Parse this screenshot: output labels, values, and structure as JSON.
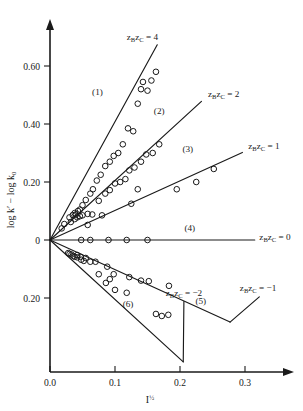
{
  "chart_data": {
    "type": "scatter",
    "title": "",
    "subtitle": "",
    "xlabel": "I½",
    "xlabel_base": "I",
    "xlabel_exp": "½",
    "ylabel": "log k′ − log k0",
    "ylabel_part1": "log k′ ",
    "ylabel_dash": "− ",
    "ylabel_part2": "log k",
    "ylabel_sub": "0",
    "xlim": [
      0.0,
      0.36
    ],
    "ylim": [
      -0.28,
      0.7
    ],
    "grid": false,
    "legend_position": "inline-right",
    "xticks": [
      0.0,
      0.1,
      0.2,
      0.3
    ],
    "xtick_labels": [
      "0.0",
      "0.1",
      "0.2",
      "0.3"
    ],
    "yticks": [
      0.6,
      0.4,
      0.2,
      0.0,
      -0.2
    ],
    "ytick_labels": [
      "0.60",
      "0.40",
      "0.20",
      "0",
      "0.20"
    ],
    "series": [
      {
        "id": 1,
        "number_label": "(1)",
        "z_label": "zBzC = 4",
        "z_label_prefix": "z",
        "z_sub_b": "B",
        "z_mid": "z",
        "z_sub_c": "C",
        "z_value": " = 4",
        "slope": 4.08,
        "line_x": [
          0.0,
          0.165
        ],
        "line_y": [
          0.0,
          0.673
        ],
        "points_x": [
          0.018,
          0.022,
          0.03,
          0.035,
          0.038,
          0.04,
          0.043,
          0.046,
          0.05,
          0.055,
          0.062,
          0.066,
          0.072,
          0.078,
          0.085,
          0.092,
          0.098,
          0.105,
          0.112,
          0.12,
          0.128,
          0.135,
          0.14,
          0.143,
          0.15,
          0.156,
          0.163
        ],
        "points_y": [
          0.04,
          0.055,
          0.078,
          0.086,
          0.093,
          0.088,
          0.1,
          0.105,
          0.12,
          0.138,
          0.16,
          0.175,
          0.205,
          0.225,
          0.255,
          0.27,
          0.29,
          0.3,
          0.33,
          0.385,
          0.375,
          0.47,
          0.52,
          0.545,
          0.515,
          0.55,
          0.58
        ]
      },
      {
        "id": 2,
        "number_label": "(2)",
        "z_label": "zBzC = 2",
        "z_label_prefix": "z",
        "z_sub_b": "B",
        "z_mid": "z",
        "z_sub_c": "C",
        "z_value": " = 2",
        "slope": 2.05,
        "line_x": [
          0.0,
          0.233
        ],
        "line_y": [
          0.0,
          0.478
        ],
        "points_x": [
          0.032,
          0.038,
          0.042,
          0.046,
          0.05,
          0.058,
          0.065,
          0.075,
          0.085,
          0.092,
          0.1,
          0.108,
          0.116,
          0.122,
          0.13,
          0.14,
          0.148,
          0.158,
          0.168
        ],
        "points_y": [
          0.062,
          0.072,
          0.078,
          0.082,
          0.085,
          0.09,
          0.088,
          0.135,
          0.16,
          0.172,
          0.195,
          0.2,
          0.21,
          0.24,
          0.25,
          0.27,
          0.295,
          0.3,
          0.33
        ]
      },
      {
        "id": 3,
        "number_label": "(3)",
        "z_label": "zBzC = 1",
        "z_label_prefix": "z",
        "z_sub_b": "B",
        "z_mid": "z",
        "z_sub_c": "C",
        "z_value": " = 1",
        "slope": 1.02,
        "line_x": [
          0.0,
          0.296
        ],
        "line_y": [
          0.0,
          0.302
        ],
        "points_x": [
          0.058,
          0.08,
          0.125,
          0.135,
          0.195,
          0.225,
          0.252
        ],
        "points_y": [
          0.052,
          0.085,
          0.125,
          0.175,
          0.175,
          0.2,
          0.245
        ]
      },
      {
        "id": 4,
        "number_label": "(4)",
        "z_label": "zBzC = 0",
        "z_label_prefix": "z",
        "z_sub_b": "B",
        "z_mid": "z",
        "z_sub_c": "C",
        "z_value": " = 0",
        "slope": 0.0,
        "line_x": [
          0.0,
          0.315
        ],
        "line_y": [
          0.0,
          0.0
        ],
        "points_x": [
          0.048,
          0.062,
          0.09,
          0.118,
          0.15
        ],
        "points_y": [
          0.0,
          0.0,
          0.0,
          0.0,
          0.0
        ]
      },
      {
        "id": 5,
        "number_label": "(5)",
        "z_label": "zBzC = −1",
        "z_label_prefix": "z",
        "z_sub_b": "B",
        "z_mid": "z",
        "z_sub_c": "C",
        "z_value": " = −1",
        "slope": -1.02,
        "line_x": [
          0.0,
          0.277
        ],
        "line_y": [
          0.0,
          -0.283
        ],
        "points_x": [
          0.028,
          0.033,
          0.038,
          0.042,
          0.047,
          0.055,
          0.07,
          0.088,
          0.098,
          0.122,
          0.14,
          0.152,
          0.183
        ],
        "points_y": [
          -0.045,
          -0.05,
          -0.058,
          -0.052,
          -0.058,
          -0.062,
          -0.075,
          -0.092,
          -0.118,
          -0.128,
          -0.14,
          -0.142,
          -0.158
        ]
      },
      {
        "id": 6,
        "number_label": "(6)",
        "z_label": "zBzC = −2",
        "z_label_prefix": "z",
        "z_sub_b": "B",
        "z_mid": "z",
        "z_sub_c": "C",
        "z_value": " = −2",
        "slope": -2.05,
        "line_x": [
          0.0,
          0.205
        ],
        "line_y": [
          0.0,
          -0.42
        ],
        "points_x": [
          0.03,
          0.036,
          0.042,
          0.048,
          0.052,
          0.062,
          0.075,
          0.086,
          0.092,
          0.1,
          0.118,
          0.163,
          0.172,
          0.182
        ],
        "points_y": [
          -0.048,
          -0.055,
          -0.06,
          -0.068,
          -0.072,
          -0.075,
          -0.118,
          -0.148,
          -0.135,
          -0.172,
          -0.182,
          -0.255,
          -0.262,
          -0.258
        ]
      }
    ],
    "annotations": [
      {
        "text": "(1)",
        "x": 0.073,
        "y": 0.5
      },
      {
        "text": "(2)",
        "x": 0.168,
        "y": 0.436
      },
      {
        "text": "(3)",
        "x": 0.212,
        "y": 0.302
      },
      {
        "text": "(4)",
        "x": 0.215,
        "y": 0.03
      },
      {
        "text": "(5)",
        "x": 0.232,
        "y": -0.222
      },
      {
        "text": "(6)",
        "x": 0.12,
        "y": -0.23
      }
    ]
  },
  "axes": {
    "x_arrow": true,
    "y_arrow": true,
    "x_tick_labels": [
      "0.0",
      "0.1",
      "0.2",
      "0.3"
    ],
    "y_tick_labels": [
      "0.60",
      "0.40",
      "0.20",
      "0",
      "0.20"
    ]
  }
}
